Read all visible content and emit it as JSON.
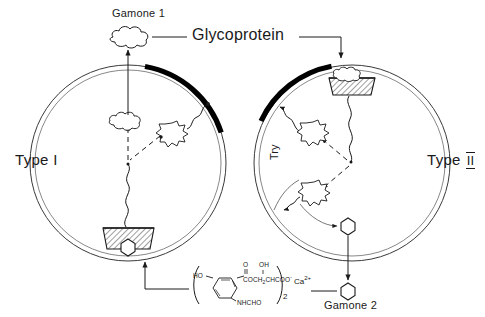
{
  "figure": {
    "title_visible": false,
    "background": "#ffffff",
    "ink": "#1a1a1a"
  },
  "labels": {
    "gamone1": "Gamone 1",
    "glycoprotein": "Glycoprotein",
    "type1": "Type I",
    "type2_prefix": "Type ",
    "type2_numeral": "II",
    "try": "Try",
    "gamone2": "Gamone 2"
  },
  "chemistry": {
    "calcium": "Ca",
    "calcium_charge": "2+",
    "bracket_subscript": "2",
    "ring_oh": "HO",
    "carbonyl_o": "O",
    "hydroxyl_oh": "OH",
    "side_chain": "COCH",
    "side_chain_sub": "2",
    "side_chain_2": "CHCOO",
    "side_chain_charge": "-",
    "amide": "NHCHO"
  },
  "cells": [
    {
      "name": "type-i-cell",
      "label": "Type I",
      "cx": 128,
      "cy": 163,
      "r": 98,
      "receptor_position": "bottom",
      "active_arc": "upper-right",
      "contains": [
        "glycoprotein-blob",
        "starburst",
        "receptor",
        "gamone2-hexagon"
      ]
    },
    {
      "name": "type-ii-cell",
      "label": "Type II",
      "cx": 352,
      "cy": 163,
      "r": 98,
      "receptor_position": "top",
      "active_arc": "upper-left",
      "contains": [
        "glycoprotein-blob-in-receptor",
        "starburst-upper",
        "starburst-lower",
        "gamone2-hexagon"
      ]
    }
  ],
  "legend": {
    "gamone1_is": "glycoprotein",
    "gamone2_is": "calcium salt of hydroxy-formylamino-phenyl compound"
  }
}
